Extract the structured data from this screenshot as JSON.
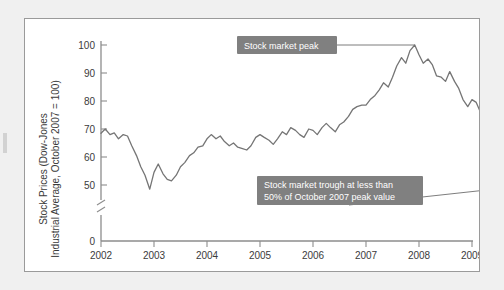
{
  "figure": {
    "background_color": "#f0f0f0",
    "panel_color": "#ffffff",
    "border_color": "#9a9a9a",
    "line_color": "#757575",
    "callout_color": "#808080",
    "callout_text_color": "#ffffff"
  },
  "axes": {
    "y_axis_title_line1": "Stock Prices (Dow-Jones",
    "y_axis_title_line2": "Industrial Average, October 2007 = 100)",
    "y_ticks": [
      "100",
      "90",
      "80",
      "70",
      "60",
      "50",
      "0"
    ],
    "y_axis_break": true,
    "x_ticks": [
      "2002",
      "2003",
      "2004",
      "2005",
      "2006",
      "2007",
      "2008",
      "2009"
    ]
  },
  "annotations": [
    {
      "name": "peak-callout",
      "lines": [
        "Stock market peak"
      ]
    },
    {
      "name": "trough-callout",
      "lines": [
        "Stock market trough at less than",
        "50% of October 2007 peak value"
      ]
    }
  ],
  "chart_data": {
    "type": "line",
    "title": "",
    "xlabel": "",
    "ylabel": "Stock Prices (Dow-Jones Industrial Average, October 2007 = 100)",
    "xlim": [
      2002.0,
      2009.42
    ],
    "ylim": [
      46,
      101
    ],
    "y_axis_note": "Axis broken between 0 and 50",
    "grid": false,
    "legend": "none",
    "x_tick_values": [
      2002,
      2003,
      2004,
      2005,
      2006,
      2007,
      2008,
      2009
    ],
    "y_tick_values": [
      0,
      50,
      60,
      70,
      80,
      90,
      100
    ],
    "series": [
      {
        "name": "Dow-Jones Industrial Average (Oct 2007 = 100)",
        "x": [
          2002.0,
          2002.08,
          2002.17,
          2002.25,
          2002.33,
          2002.42,
          2002.5,
          2002.58,
          2002.67,
          2002.75,
          2002.83,
          2002.92,
          2003.0,
          2003.08,
          2003.17,
          2003.25,
          2003.33,
          2003.42,
          2003.5,
          2003.58,
          2003.67,
          2003.75,
          2003.83,
          2003.92,
          2004.0,
          2004.08,
          2004.17,
          2004.25,
          2004.33,
          2004.42,
          2004.5,
          2004.58,
          2004.67,
          2004.75,
          2004.83,
          2004.92,
          2005.0,
          2005.08,
          2005.17,
          2005.25,
          2005.33,
          2005.42,
          2005.5,
          2005.58,
          2005.67,
          2005.75,
          2005.83,
          2005.92,
          2006.0,
          2006.08,
          2006.17,
          2006.25,
          2006.33,
          2006.42,
          2006.5,
          2006.58,
          2006.67,
          2006.75,
          2006.83,
          2006.92,
          2007.0,
          2007.08,
          2007.17,
          2007.25,
          2007.33,
          2007.42,
          2007.5,
          2007.58,
          2007.67,
          2007.75,
          2007.83,
          2007.92,
          2008.0,
          2008.08,
          2008.17,
          2008.25,
          2008.33,
          2008.42,
          2008.5,
          2008.58,
          2008.67,
          2008.75,
          2008.83,
          2008.92,
          2009.0,
          2009.08,
          2009.17,
          2009.25,
          2009.33
        ],
        "y": [
          68.5,
          70.0,
          68.0,
          68.6,
          66.5,
          68.0,
          67.5,
          64.0,
          60.5,
          56.5,
          53.5,
          48.5,
          54.5,
          57.5,
          54.0,
          52.0,
          51.5,
          53.5,
          56.5,
          58.0,
          60.5,
          61.5,
          63.5,
          64.0,
          66.5,
          68.0,
          66.5,
          67.5,
          65.5,
          64.0,
          65.0,
          63.5,
          63.0,
          62.5,
          64.0,
          67.0,
          68.0,
          67.0,
          66.0,
          64.5,
          66.5,
          69.0,
          68.0,
          70.5,
          69.5,
          68.0,
          67.0,
          70.0,
          69.5,
          68.0,
          70.5,
          72.0,
          70.5,
          69.0,
          71.5,
          72.5,
          74.5,
          77.0,
          78.0,
          78.5,
          78.5,
          80.5,
          82.0,
          84.0,
          86.5,
          85.0,
          88.5,
          92.5,
          95.5,
          93.5,
          98.0,
          100.0,
          96.5,
          93.5,
          95.0,
          93.0,
          89.0,
          88.5,
          87.0,
          90.5,
          87.0,
          84.5,
          80.5,
          78.0,
          80.5,
          79.5,
          75.5,
          73.0,
          74.5
        ]
      }
    ],
    "annotations": [
      {
        "text": "Stock market peak",
        "points_to": {
          "x": 2007.92,
          "y": 100.0
        }
      },
      {
        "text": "Stock market trough at less than 50% of October 2007 peak value",
        "points_to": {
          "x": 2009.17,
          "y": 48.0
        }
      }
    ]
  }
}
